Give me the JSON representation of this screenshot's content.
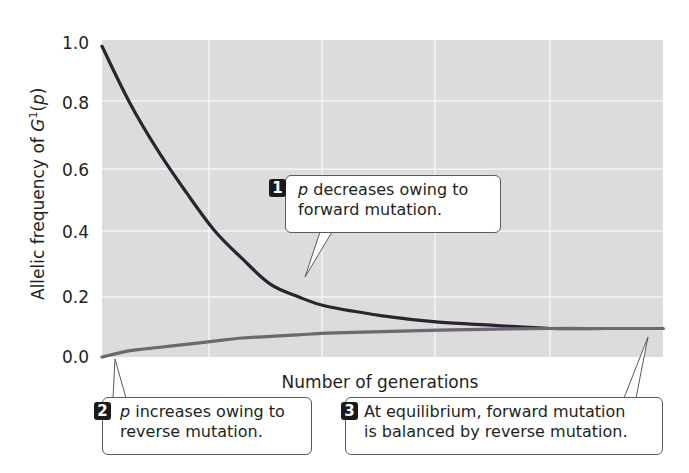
{
  "chart_data": {
    "type": "line",
    "title": "",
    "xlabel": "Number of generations",
    "ylabel": "Allelic frequency of G¹(p)",
    "ylabel_parts": {
      "prefix": "Allelic frequency of ",
      "gene": "G",
      "sup": "1",
      "paren_open": "(",
      "var": "p",
      "paren_close": ")"
    },
    "yticks": [
      "0.0",
      "0.2",
      "0.4",
      "0.6",
      "0.8",
      "1.0"
    ],
    "ylim": [
      0,
      1.0
    ],
    "xlim": [
      0,
      5
    ],
    "xticks_labeled": false,
    "grid": true,
    "x": [
      0,
      0.25,
      0.5,
      0.75,
      1.0,
      1.25,
      1.5,
      1.75,
      2.0,
      2.5,
      3.0,
      3.5,
      4.0,
      4.5,
      5.0
    ],
    "series": [
      {
        "name": "p decreasing (starts at 1.0, forward mutation)",
        "color": "#2b2430",
        "values": [
          0.98,
          0.8,
          0.65,
          0.52,
          0.4,
          0.31,
          0.23,
          0.19,
          0.16,
          0.13,
          0.11,
          0.1,
          0.09,
          0.09,
          0.09
        ]
      },
      {
        "name": "p increasing (starts at 0.0, reverse mutation)",
        "color": "#6e6670",
        "values": [
          0.0,
          0.02,
          0.03,
          0.04,
          0.05,
          0.06,
          0.065,
          0.07,
          0.075,
          0.08,
          0.085,
          0.088,
          0.09,
          0.09,
          0.09
        ]
      }
    ],
    "equilibrium": 0.09,
    "annotations": [
      {
        "number": "1",
        "var": "p",
        "text1": " decreases owing to",
        "text2": "forward mutation."
      },
      {
        "number": "2",
        "var": "p",
        "text1": " increases owing to",
        "text2": "reverse mutation."
      },
      {
        "number": "3",
        "var": "",
        "text1": "At equilibrium, forward mutation",
        "text2": "is balanced by reverse mutation."
      }
    ]
  },
  "colors": {
    "plot_bg": "#dcdcdc",
    "grid": "#f4f4f4",
    "curve_dark": "#2b2430",
    "curve_light": "#6e6670",
    "badge": "#1a1a1a"
  }
}
